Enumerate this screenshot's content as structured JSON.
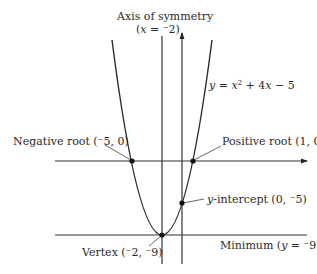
{
  "diagram": {
    "equation": {
      "prefix": "y",
      "eq": " = ",
      "x": "x",
      "sup": "2",
      "rest": " + 4",
      "x2": "x",
      "tail": " − 5"
    },
    "axis_of_symmetry": {
      "title": "Axis of symmetry",
      "eq_open": "(",
      "var": "x",
      "eq_value": " = ⁻2)"
    },
    "negative_root": {
      "label": "Negative root (⁻5, 0)",
      "x": -5,
      "y": 0
    },
    "positive_root": {
      "label": "Positive root (1, 0)",
      "x": 1,
      "y": 0
    },
    "y_intercept": {
      "var": "y",
      "label": "-intercept (0, ⁻5)",
      "x": 0,
      "y": -5
    },
    "vertex": {
      "label": "Vertex (⁻2, ⁻9)",
      "x": -2,
      "y": -9
    },
    "minimum": {
      "prefix": "Minimum (",
      "var": "y",
      "suffix": " = ⁻9)"
    },
    "colors": {
      "ink": "#2a2a2a",
      "background": "#ffffff"
    }
  }
}
